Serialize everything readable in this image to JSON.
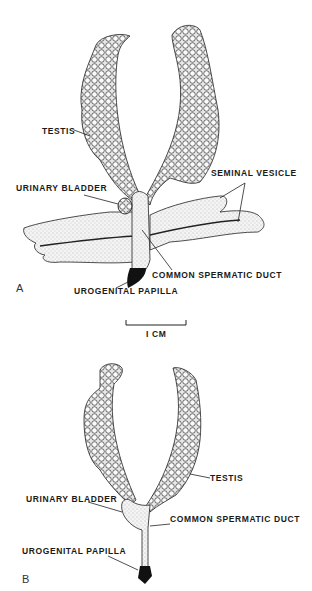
{
  "figure": {
    "panel_a": {
      "letter": "A",
      "labels": {
        "testis": "TESTIS",
        "urinary_bladder": "URINARY BLADDER",
        "seminal_vesicle": "SEMINAL VESICLE",
        "common_spermatic_duct": "COMMON SPERMATIC DUCT",
        "urogenital_papilla": "UROGENITAL PAPILLA"
      }
    },
    "scale_bar": {
      "label": "I CM"
    },
    "panel_b": {
      "letter": "B",
      "labels": {
        "testis": "TESTIS",
        "urinary_bladder": "URINARY BLADDER",
        "common_spermatic_duct": "COMMON SPERMATIC DUCT",
        "urogenital_papilla": "UROGENITAL PAPILLA"
      }
    }
  }
}
